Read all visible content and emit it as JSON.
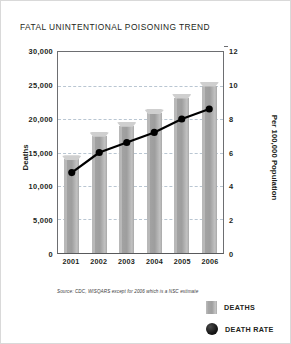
{
  "title": "FATAL UNINTENTIONAL POISONING TREND",
  "source_note": "Source: CDC, WISQARS except for 2006 which is a NSC estimate",
  "legend": {
    "deaths_label": "DEATHS",
    "death_rate_label": "DEATH RATE"
  },
  "colors": {
    "bar": "#a6a6a6",
    "line": "#000000",
    "gridline": "#b9c6d2",
    "axis": "#6d6e71",
    "text": "#231f20"
  },
  "chart_data": {
    "type": "bar",
    "title": "FATAL UNINTENTIONAL POISONING TREND",
    "xlabel": "",
    "ylabel": "Deaths",
    "y2label": "Per 100,000 Population",
    "categories": [
      "2001",
      "2002",
      "2003",
      "2004",
      "2005",
      "2006"
    ],
    "ylim": [
      0,
      30000
    ],
    "yticks": [
      "30,000",
      "25,000",
      "20,000",
      "15,000",
      "10,000",
      "5,000",
      "0"
    ],
    "ytick_values": [
      30000,
      25000,
      20000,
      15000,
      10000,
      5000,
      0
    ],
    "y2lim": [
      0,
      12
    ],
    "y2ticks": [
      "12",
      "10",
      "8",
      "6",
      "4",
      "2",
      "0"
    ],
    "y2tick_values": [
      12,
      10,
      8,
      6,
      4,
      2,
      0
    ],
    "grid": true,
    "legend_position": "bottom-right",
    "series": [
      {
        "name": "DEATHS",
        "type": "bar",
        "axis": "left",
        "values": [
          14000,
          17500,
          19000,
          20900,
          23200,
          25000
        ]
      },
      {
        "name": "DEATH RATE",
        "type": "line",
        "axis": "right",
        "values": [
          4.8,
          6.0,
          6.6,
          7.2,
          8.0,
          8.6
        ]
      }
    ]
  }
}
